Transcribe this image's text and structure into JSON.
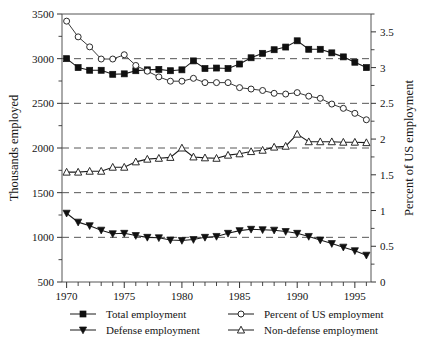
{
  "chart_data": {
    "type": "line",
    "title": "",
    "xlabel": "",
    "ylabel": "Thousands employed",
    "y2label": "Percent of US employment",
    "grid": true,
    "grid_values": [
      3000,
      2500,
      2000,
      1500,
      1000
    ],
    "legend_position": "bottom",
    "xlim": [
      1969.6,
      1996.4
    ],
    "ylim": [
      500,
      3500
    ],
    "y2lim": [
      0,
      3.75
    ],
    "xticks": [
      1970,
      1975,
      1980,
      1985,
      1990,
      1995
    ],
    "xticks_minor": [
      1971,
      1972,
      1973,
      1974,
      1976,
      1977,
      1978,
      1979,
      1981,
      1982,
      1983,
      1984,
      1986,
      1987,
      1988,
      1989,
      1991,
      1992,
      1993,
      1994,
      1996
    ],
    "xtick_labels": [
      "1970",
      "1975",
      "1980",
      "1985",
      "1990",
      "1995"
    ],
    "yticks": [
      500,
      1000,
      1500,
      2000,
      2500,
      3000,
      3500
    ],
    "ytick_labels": [
      "500",
      "1000",
      "1500",
      "2000",
      "2500",
      "3000",
      "3500"
    ],
    "yticks_minor": [
      750,
      1250,
      1750,
      2250,
      2750,
      3250
    ],
    "y2ticks": [
      0,
      0.5,
      1,
      1.5,
      2,
      2.5,
      3,
      3.5
    ],
    "y2tick_labels": [
      "0",
      "0.5",
      "1",
      "1.5",
      "2",
      "2.5",
      "3",
      "3.5"
    ],
    "y2ticks_minor": [
      0.25,
      0.75,
      1.25,
      1.75,
      2.25,
      2.75,
      3.25,
      3.75
    ],
    "x": [
      1970,
      1971,
      1972,
      1973,
      1974,
      1975,
      1976,
      1977,
      1978,
      1979,
      1980,
      1981,
      1982,
      1983,
      1984,
      1985,
      1986,
      1987,
      1988,
      1989,
      1990,
      1991,
      1992,
      1993,
      1994,
      1995,
      1996
    ],
    "series": [
      {
        "name": "Total employment",
        "marker": "square-filled",
        "axis": "left",
        "values": [
          3000,
          2900,
          2870,
          2870,
          2825,
          2830,
          2865,
          2875,
          2880,
          2865,
          2875,
          2975,
          2890,
          2895,
          2890,
          2940,
          3010,
          3060,
          3100,
          3130,
          3200,
          3105,
          3105,
          3065,
          3020,
          2960,
          2900
        ]
      },
      {
        "name": "Defense employment",
        "marker": "triangle-down-filled",
        "axis": "left",
        "values": [
          1270,
          1170,
          1130,
          1080,
          1040,
          1045,
          1020,
          1000,
          995,
          970,
          965,
          975,
          1000,
          1010,
          1045,
          1075,
          1090,
          1085,
          1080,
          1065,
          1045,
          1010,
          970,
          930,
          890,
          850,
          800
        ]
      },
      {
        "name": "Non-defense employment",
        "marker": "triangle-up-open",
        "axis": "left",
        "values": [
          1730,
          1730,
          1740,
          1740,
          1785,
          1785,
          1845,
          1875,
          1885,
          1895,
          2000,
          1900,
          1890,
          1885,
          1920,
          1935,
          1960,
          1975,
          2010,
          2020,
          2155,
          2070,
          2070,
          2070,
          2065,
          2065,
          2060
        ]
      },
      {
        "name": "Percent of US employment",
        "marker": "circle-open",
        "axis": "right",
        "values": [
          3.65,
          3.43,
          3.29,
          3.12,
          3.12,
          3.18,
          3.03,
          2.95,
          2.87,
          2.81,
          2.81,
          2.85,
          2.79,
          2.79,
          2.79,
          2.72,
          2.7,
          2.68,
          2.64,
          2.63,
          2.65,
          2.6,
          2.57,
          2.49,
          2.43,
          2.36,
          2.27
        ]
      }
    ]
  },
  "legend": {
    "entries": [
      {
        "label": "Total employment",
        "marker": "square-filled"
      },
      {
        "label": "Defense employment",
        "marker": "triangle-down-filled"
      },
      {
        "label": "Percent of US employment",
        "marker": "circle-open"
      },
      {
        "label": "Non-defense employment",
        "marker": "triangle-up-open"
      }
    ]
  },
  "colors": {
    "foreground": "#1a1a1a",
    "frame": "#555555",
    "grid": "#444444",
    "background": "#ffffff"
  }
}
